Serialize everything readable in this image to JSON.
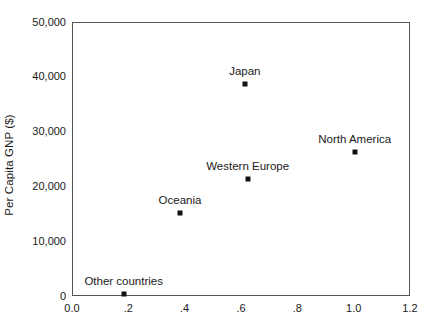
{
  "chart_data": {
    "type": "scatter",
    "title": "",
    "xlabel": "",
    "ylabel": "Per Capita GNP ($)",
    "xlim": [
      0.0,
      1.2
    ],
    "ylim": [
      0,
      50000
    ],
    "grid": false,
    "legend": "none",
    "x_tick_labels": [
      "0.0",
      ".2",
      ".4",
      ".6",
      ".8",
      "1.0",
      "1.2"
    ],
    "x_tick_values": [
      0.0,
      0.2,
      0.4,
      0.6,
      0.8,
      1.0,
      1.2
    ],
    "y_tick_labels": [
      "50,000",
      "40,000",
      "30,000",
      "20,000",
      "10,000",
      "0"
    ],
    "y_tick_values": [
      50000,
      40000,
      30000,
      20000,
      10000,
      0
    ],
    "points": [
      {
        "label": "Japan",
        "x": 0.61,
        "y": 38800,
        "label_dx": 0,
        "label_dy": -7
      },
      {
        "label": "North America",
        "x": 1.0,
        "y": 26400,
        "label_dx": 0,
        "label_dy": -7
      },
      {
        "label": "Western Europe",
        "x": 0.62,
        "y": 21500,
        "label_dx": 0,
        "label_dy": -7
      },
      {
        "label": "Oceania",
        "x": 0.38,
        "y": 15300,
        "label_dx": 0,
        "label_dy": -7
      },
      {
        "label": "Other countries",
        "x": 0.18,
        "y": 500,
        "label_dx": 0,
        "label_dy": -7
      }
    ]
  },
  "colors": {
    "marker": "#111111",
    "frame": "#555555",
    "text": "#1a1a1a",
    "background": "#ffffff"
  }
}
